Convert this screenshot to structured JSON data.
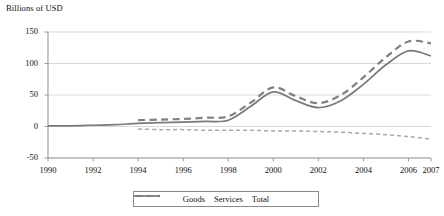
{
  "chart_data": {
    "type": "line",
    "title": "Billions of USD",
    "xlabel": "",
    "ylabel": "Billions of USD",
    "grid": true,
    "legend_position": "bottom",
    "ylim": [
      -50,
      150
    ],
    "yticks": [
      150,
      100,
      50,
      0,
      -50
    ],
    "ytick_labels": [
      "150",
      "100",
      "50",
      "0",
      "-50"
    ],
    "xticks": [
      1990,
      1992,
      1994,
      1996,
      1998,
      2000,
      2002,
      2004,
      2006,
      2007
    ],
    "xtick_labels": [
      "1990",
      "1992",
      "1994",
      "1996",
      "1998",
      "2000",
      "2002",
      "2004",
      "2006",
      "2007"
    ],
    "xlim": [
      1990,
      2007
    ],
    "series": [
      {
        "name": "Goods",
        "style": "dashed",
        "color": "#808080",
        "x": [
          1994,
          1995,
          1996,
          1997,
          1998,
          1999,
          2000,
          2001,
          2002,
          2003,
          2004,
          2005,
          2006,
          2007
        ],
        "values": [
          10,
          11,
          12,
          14,
          16,
          38,
          62,
          48,
          37,
          50,
          78,
          110,
          135,
          132
        ]
      },
      {
        "name": "Services",
        "style": "fine-dashed",
        "color": "#a8a8a8",
        "x": [
          1994,
          1995,
          1996,
          1997,
          1998,
          1999,
          2000,
          2001,
          2002,
          2003,
          2004,
          2005,
          2006,
          2007
        ],
        "values": [
          -4,
          -5,
          -5,
          -6,
          -6,
          -6,
          -7,
          -7,
          -8,
          -9,
          -11,
          -13,
          -16,
          -20
        ]
      },
      {
        "name": "Total",
        "style": "solid",
        "color": "#7a7a7a",
        "x": [
          1990,
          1991,
          1992,
          1993,
          1994,
          1995,
          1996,
          1997,
          1998,
          1999,
          2000,
          2001,
          2002,
          2003,
          2004,
          2005,
          2006,
          2007
        ],
        "values": [
          1,
          1,
          2,
          3,
          5,
          6,
          7,
          8,
          10,
          32,
          55,
          41,
          30,
          41,
          67,
          98,
          120,
          112
        ]
      }
    ]
  },
  "legend": {
    "entries": [
      {
        "label": "Goods",
        "icon": "dashed-line-swatch"
      },
      {
        "label": "Services",
        "icon": "fine-dashed-line-swatch"
      },
      {
        "label": "Total",
        "icon": "solid-line-swatch"
      }
    ]
  },
  "colors": {
    "grid": "#cfcfcf",
    "axis": "#9a9a9a",
    "goods": "#808080",
    "services": "#a8a8a8",
    "total": "#7a7a7a",
    "text": "#111111"
  }
}
